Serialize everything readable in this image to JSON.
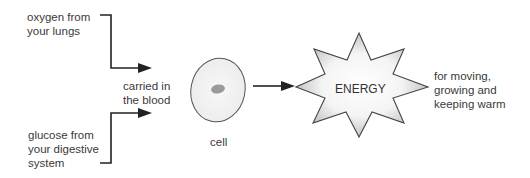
{
  "diagram": {
    "inputs": [
      {
        "label_lines": [
          "oxygen from",
          "your lungs"
        ]
      },
      {
        "label_lines": [
          "glucose from",
          "your digestive",
          "system"
        ]
      }
    ],
    "transport": {
      "label_lines": [
        "carried in",
        "the blood"
      ]
    },
    "cell": {
      "label": "cell"
    },
    "energy": {
      "label": "ENERGY"
    },
    "uses": {
      "label_lines": [
        "for moving,",
        "growing and",
        "keeping warm"
      ]
    }
  }
}
